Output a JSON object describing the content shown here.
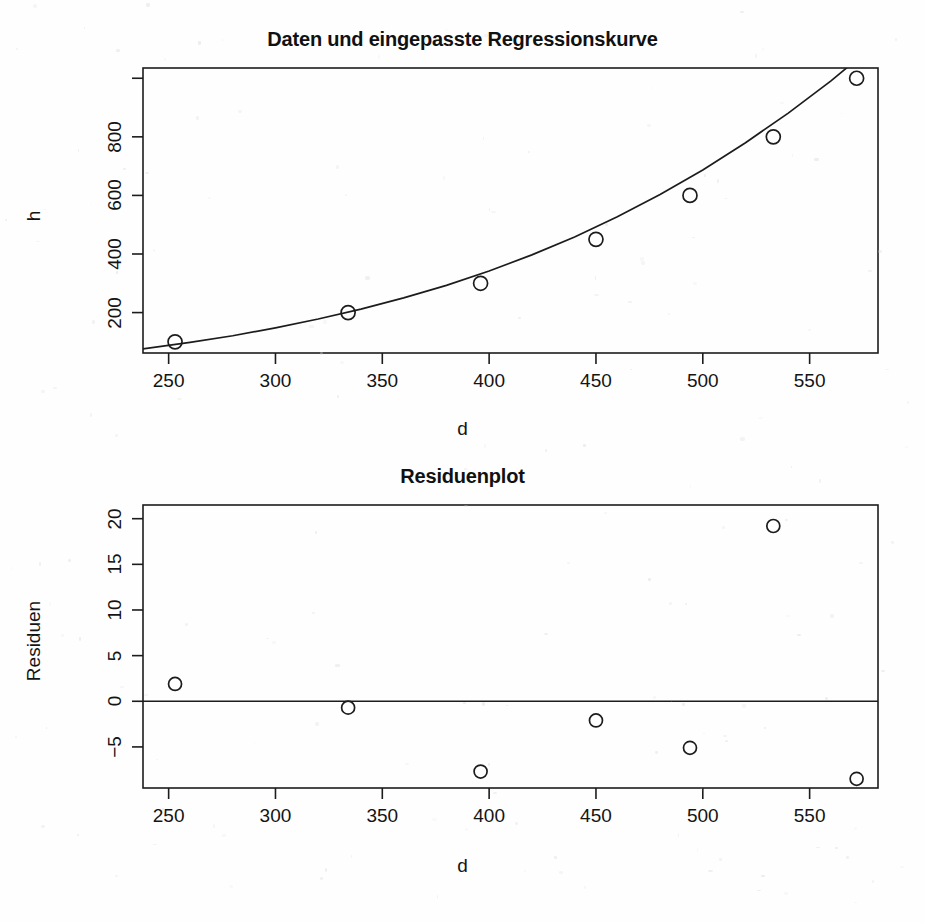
{
  "figure": {
    "background_color": "#fefefe",
    "foreground_color": "#1a1a1a"
  },
  "panels": [
    {
      "id": "regression",
      "title": "Daten und eingepasste Regressionskurve",
      "xlabel": "d",
      "ylabel": "h"
    },
    {
      "id": "residuals",
      "title": "Residuenplot",
      "xlabel": "d",
      "ylabel": "Residuen"
    }
  ],
  "chart_data": [
    {
      "type": "scatter",
      "title": "Daten und eingepasste Regressionskurve",
      "xlabel": "d",
      "ylabel": "h",
      "xlim": [
        238,
        582
      ],
      "ylim": [
        62,
        1035
      ],
      "xticks": [
        250,
        300,
        350,
        400,
        450,
        500,
        550
      ],
      "xtick_labels": [
        "250",
        "300",
        "350",
        "400",
        "450",
        "500",
        "550"
      ],
      "yticks": [
        200,
        400,
        600,
        800,
        1000
      ],
      "ytick_labels": [
        "200",
        "400",
        "600",
        "800",
        ""
      ],
      "grid": false,
      "legend": null,
      "series": [
        {
          "name": "Daten",
          "marker": "open-circle",
          "x": [
            253,
            334,
            396,
            450,
            494,
            533,
            572
          ],
          "y": [
            100,
            200,
            300,
            450,
            600,
            800,
            1000
          ]
        },
        {
          "name": "eingepasste Regressionskurve",
          "marker": "line",
          "model": "exponential",
          "x": [
            238,
            260,
            280,
            300,
            320,
            340,
            360,
            380,
            400,
            420,
            440,
            460,
            480,
            500,
            520,
            540,
            560,
            578
          ],
          "y": [
            76,
            98,
            121,
            148,
            178,
            212,
            250,
            293,
            342,
            397,
            458,
            527,
            603,
            687,
            780,
            881,
            991,
            1100
          ]
        }
      ]
    },
    {
      "type": "scatter",
      "title": "Residuenplot",
      "xlabel": "d",
      "ylabel": "Residuen",
      "xlim": [
        238,
        582
      ],
      "ylim": [
        -9.5,
        21.5
      ],
      "xticks": [
        250,
        300,
        350,
        400,
        450,
        500,
        550
      ],
      "xtick_labels": [
        "250",
        "300",
        "350",
        "400",
        "450",
        "500",
        "550"
      ],
      "yticks": [
        -5,
        0,
        5,
        10,
        15,
        20
      ],
      "ytick_labels": [
        "−5",
        "0",
        "5",
        "10",
        "15",
        "20"
      ],
      "grid": false,
      "legend": null,
      "reference_line": {
        "y": 0
      },
      "series": [
        {
          "name": "Residuen",
          "marker": "open-circle",
          "x": [
            253,
            334,
            396,
            450,
            494,
            533,
            572
          ],
          "y": [
            1.9,
            -0.7,
            -7.7,
            -2.1,
            -5.1,
            19.2,
            -8.5
          ]
        }
      ]
    }
  ]
}
